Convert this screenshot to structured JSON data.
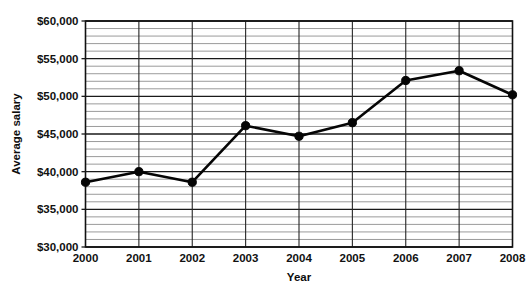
{
  "chart_data": {
    "type": "line",
    "title": "",
    "subtitle": "",
    "xlabel": "Year",
    "ylabel": "Average salary",
    "x": [
      2000,
      2001,
      2002,
      2003,
      2004,
      2005,
      2006,
      2007,
      2008
    ],
    "categories": [
      "2000",
      "2001",
      "2002",
      "2003",
      "2004",
      "2005",
      "2006",
      "2007",
      "2008"
    ],
    "values": [
      38600,
      40000,
      38600,
      46100,
      44700,
      46500,
      52100,
      53400,
      50200
    ],
    "series": [
      {
        "name": "Average salary",
        "values": [
          38600,
          40000,
          38600,
          46100,
          44700,
          46500,
          52100,
          53400,
          50200
        ]
      }
    ],
    "ylim": [
      30000,
      60000
    ],
    "ytick_values": [
      30000,
      35000,
      40000,
      45000,
      50000,
      55000,
      60000
    ],
    "ytick_labels": [
      "$30,000",
      "$35,000",
      "$40,000",
      "$45,000",
      "$50,000",
      "$55,000",
      "$60,000"
    ],
    "xtick_labels": [
      "2000",
      "2001",
      "2002",
      "2003",
      "2004",
      "2005",
      "2006",
      "2007",
      "2008"
    ],
    "y_major_step": 5000,
    "y_minor_step": 1000,
    "grid": true,
    "grid_minor": true,
    "legend": false,
    "legend_position": "none",
    "marker": "circle",
    "line_color": "#050505",
    "marker_color": "#050505",
    "grid_major_color": "#1a1a1a",
    "grid_minor_color": "#8f8f8f",
    "background_color": "#ffffff",
    "annotations": []
  },
  "axis": {
    "y_title": "Average salary",
    "x_title": "Year"
  }
}
